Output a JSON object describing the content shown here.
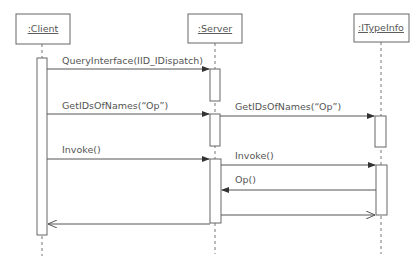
{
  "diagram": {
    "type": "uml-sequence",
    "objects": [
      {
        "id": "client",
        "label": ":Client"
      },
      {
        "id": "server",
        "label": ":Server"
      },
      {
        "id": "itypeinfo",
        "label": ":ITypeInfo"
      }
    ],
    "messages": [
      {
        "from": "client",
        "to": "server",
        "label": "QueryInterface(IID_IDispatch)",
        "kind": "sync"
      },
      {
        "from": "client",
        "to": "server",
        "label": "GetIDsOfNames(“Op”)",
        "kind": "sync"
      },
      {
        "from": "server",
        "to": "itypeinfo",
        "label": "GetIDsOfNames(“Op”)",
        "kind": "sync"
      },
      {
        "from": "client",
        "to": "server",
        "label": "Invoke()",
        "kind": "sync"
      },
      {
        "from": "server",
        "to": "itypeinfo",
        "label": "Invoke()",
        "kind": "sync"
      },
      {
        "from": "itypeinfo",
        "to": "server",
        "label": "Op()",
        "kind": "sync"
      },
      {
        "from": "server",
        "to": "itypeinfo",
        "label": "",
        "kind": "return"
      },
      {
        "from": "server",
        "to": "client",
        "label": "",
        "kind": "return"
      }
    ]
  }
}
